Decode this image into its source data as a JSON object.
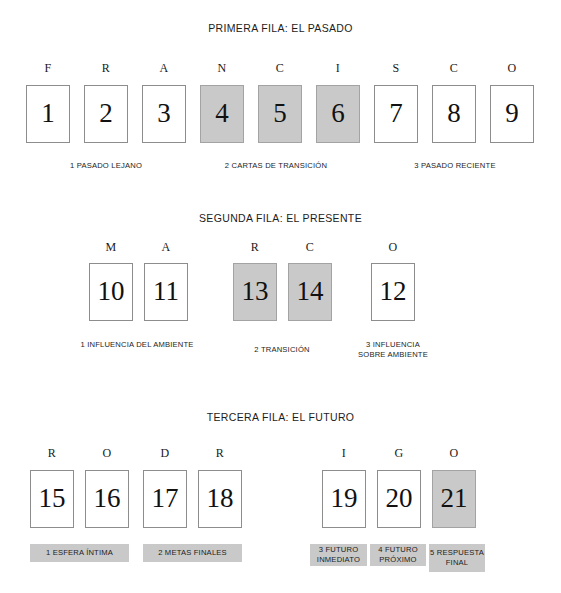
{
  "document": {
    "kind": "tarot-spread-diagram",
    "colors": {
      "shaded_fill": "#c9c9c9",
      "card_border": "#8d8d8d",
      "background": "#ffffff",
      "text": "#1c1c1c"
    }
  },
  "rows": [
    {
      "id": "row-1",
      "title": "PRIMERA FILA: EL PASADO",
      "letters": [
        "F",
        "R",
        "A",
        "N",
        "C",
        "I",
        "S",
        "C",
        "O"
      ],
      "word": "FRANCISCO",
      "cards": [
        {
          "number": "1",
          "letter": "F",
          "shaded": false
        },
        {
          "number": "2",
          "letter": "R",
          "shaded": false
        },
        {
          "number": "3",
          "letter": "A",
          "shaded": false
        },
        {
          "number": "4",
          "letter": "N",
          "shaded": true
        },
        {
          "number": "5",
          "letter": "C",
          "shaded": true
        },
        {
          "number": "6",
          "letter": "I",
          "shaded": true
        },
        {
          "number": "7",
          "letter": "S",
          "shaded": false
        },
        {
          "number": "8",
          "letter": "C",
          "shaded": false
        },
        {
          "number": "9",
          "letter": "O",
          "shaded": false
        }
      ],
      "captions": [
        {
          "text": "1 PASADO LEJANO",
          "covers": [
            "1",
            "2",
            "3"
          ]
        },
        {
          "text": "2 CARTAS DE TRANSICIÓN",
          "covers": [
            "4",
            "5",
            "6"
          ]
        },
        {
          "text": "3 PASADO RECIENTE",
          "covers": [
            "7",
            "8",
            "9"
          ]
        }
      ]
    },
    {
      "id": "row-2",
      "title": "SEGUNDA FILA: EL PRESENTE",
      "letters": [
        "M",
        "A",
        "R",
        "C",
        "O"
      ],
      "word": "MARCO",
      "cards": [
        {
          "number": "10",
          "letter": "M",
          "shaded": false
        },
        {
          "number": "11",
          "letter": "A",
          "shaded": false
        },
        {
          "number": "13",
          "letter": "R",
          "shaded": true
        },
        {
          "number": "14",
          "letter": "C",
          "shaded": true
        },
        {
          "number": "12",
          "letter": "O",
          "shaded": false
        }
      ],
      "captions": [
        {
          "text": "1 INFLUENCIA DEL AMBIENTE",
          "covers": [
            "10",
            "11"
          ]
        },
        {
          "text": "2 TRANSICIÓN",
          "covers": [
            "13",
            "14"
          ]
        },
        {
          "text": "3 INFLUENCIA SOBRE AMBIENTE",
          "covers": [
            "12"
          ]
        }
      ]
    },
    {
      "id": "row-3",
      "title": "TERCERA FILA: EL FUTURO",
      "letters": [
        "R",
        "O",
        "D",
        "R",
        "I",
        "G",
        "O"
      ],
      "word": "RODRIGO",
      "cards": [
        {
          "number": "15",
          "letter": "R",
          "shaded": false
        },
        {
          "number": "16",
          "letter": "O",
          "shaded": false
        },
        {
          "number": "17",
          "letter": "D",
          "shaded": false
        },
        {
          "number": "18",
          "letter": "R",
          "shaded": false
        },
        {
          "number": "19",
          "letter": "I",
          "shaded": false
        },
        {
          "number": "20",
          "letter": "G",
          "shaded": false
        },
        {
          "number": "21",
          "letter": "O",
          "shaded": true
        }
      ],
      "captions": [
        {
          "text": "1 ESFERA ÍNTIMA",
          "covers": [
            "15",
            "16"
          ],
          "boxed": true
        },
        {
          "text": "2 METAS FINALES",
          "covers": [
            "17",
            "18"
          ],
          "boxed": true
        },
        {
          "text": "3 FUTURO INMEDIATO",
          "covers": [
            "19"
          ],
          "boxed": true
        },
        {
          "text": "4 FUTURO PRÓXIMO",
          "covers": [
            "20"
          ],
          "boxed": true
        },
        {
          "text": "5 RESPUESTA FINAL",
          "covers": [
            "21"
          ],
          "boxed": true
        }
      ]
    }
  ]
}
